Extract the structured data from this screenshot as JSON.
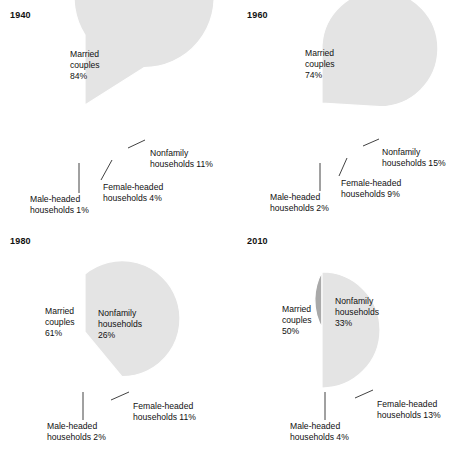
{
  "figure": {
    "background": "#ffffff",
    "colors": {
      "light": "#e4e4e4",
      "dark": "#a9a9a9",
      "separator": "#ffffff",
      "text": "#111111"
    }
  },
  "chart_data": [
    {
      "type": "pie",
      "title": "1940",
      "start_angle_deg": 90,
      "direction": "clockwise",
      "categories": [
        "Nonfamily households",
        "Female-headed households",
        "Male-headed households",
        "Married couples"
      ],
      "values": [
        11,
        4,
        1,
        84
      ],
      "slices": [
        {
          "name": "Nonfamily households",
          "value": 11,
          "value_label": "11%",
          "shade": "dark",
          "label_lines": [
            "Nonfamily",
            "households 11%"
          ],
          "label_mode": "callout",
          "label_x": 150,
          "label_y": 156,
          "lead": [
            128,
            148,
            145,
            140
          ]
        },
        {
          "name": "Female-headed households",
          "value": 4,
          "value_label": "4%",
          "shade": "dark",
          "label_lines": [
            "Female-headed",
            "households 4%"
          ],
          "label_mode": "callout",
          "label_x": 103,
          "label_y": 190,
          "lead": [
            101,
            180,
            112,
            160
          ]
        },
        {
          "name": "Male-headed households",
          "value": 1,
          "value_label": "1%",
          "shade": "light",
          "label_lines": [
            "Male-headed",
            "households 1%"
          ],
          "label_mode": "callout",
          "label_x": 30,
          "label_y": 202,
          "lead": [
            79,
            193,
            79,
            163
          ]
        },
        {
          "name": "Married couples",
          "value": 84,
          "value_label": "84%",
          "shade": "light",
          "label_lines": [
            "Married",
            "couples",
            "84%"
          ],
          "label_mode": "inside",
          "label_x": 70,
          "label_y": 57
        }
      ],
      "geometry": {
        "cx": 85,
        "cy": 105,
        "r": 70
      }
    },
    {
      "type": "pie",
      "title": "1960",
      "start_angle_deg": 90,
      "direction": "clockwise",
      "categories": [
        "Nonfamily households",
        "Female-headed households",
        "Male-headed households",
        "Married couples"
      ],
      "values": [
        15,
        9,
        2,
        74
      ],
      "slices": [
        {
          "name": "Nonfamily households",
          "value": 15,
          "value_label": "15%",
          "shade": "dark",
          "label_lines": [
            "Nonfamily",
            "households 15%"
          ],
          "label_mode": "callout",
          "label_x": 145,
          "label_y": 155,
          "lead": [
            126,
            146,
            142,
            139
          ]
        },
        {
          "name": "Female-headed households",
          "value": 9,
          "value_label": "9%",
          "shade": "dark",
          "label_lines": [
            "Female-headed",
            "households 9%"
          ],
          "label_mode": "callout",
          "label_x": 104,
          "label_y": 186,
          "lead": [
            102,
            176,
            110,
            158
          ]
        },
        {
          "name": "Male-headed households",
          "value": 2,
          "value_label": "2%",
          "shade": "light",
          "label_lines": [
            "Male-headed",
            "households 2%"
          ],
          "label_mode": "callout",
          "label_x": 33,
          "label_y": 200,
          "lead": [
            83,
            191,
            83,
            163
          ]
        },
        {
          "name": "Married couples",
          "value": 74,
          "value_label": "74%",
          "shade": "light",
          "label_lines": [
            "Married",
            "couples",
            "74%"
          ],
          "label_mode": "inside",
          "label_x": 68,
          "label_y": 56
        }
      ],
      "geometry": {
        "cx": 85,
        "cy": 103,
        "r": 58
      }
    },
    {
      "type": "pie",
      "title": "1980",
      "start_angle_deg": 90,
      "direction": "clockwise",
      "categories": [
        "Nonfamily households",
        "Female-headed households",
        "Male-headed households",
        "Married couples"
      ],
      "values": [
        26,
        11,
        2,
        61
      ],
      "slices": [
        {
          "name": "Nonfamily households",
          "value": 26,
          "value_label": "26%",
          "shade": "dark",
          "label_lines": [
            "Nonfamily",
            "households",
            "26%"
          ],
          "label_mode": "inside",
          "label_x": 98,
          "label_y": 90
        },
        {
          "name": "Female-headed households",
          "value": 11,
          "value_label": "11%",
          "shade": "dark",
          "label_lines": [
            "Female-headed",
            "households 11%"
          ],
          "label_mode": "callout",
          "label_x": 133,
          "label_y": 183,
          "lead": [
            111,
            174,
            129,
            166
          ]
        },
        {
          "name": "Male-headed households",
          "value": 2,
          "value_label": "2%",
          "shade": "light",
          "label_lines": [
            "Male-headed",
            "households 2%"
          ],
          "label_mode": "callout",
          "label_x": 47,
          "label_y": 203,
          "lead": [
            83,
            194,
            83,
            166
          ]
        },
        {
          "name": "Married couples",
          "value": 61,
          "value_label": "61%",
          "shade": "light",
          "label_lines": [
            "Married",
            "couples",
            "61%"
          ],
          "label_mode": "inside",
          "label_x": 45,
          "label_y": 88
        }
      ],
      "geometry": {
        "cx": 85,
        "cy": 106,
        "r": 58
      }
    },
    {
      "type": "pie",
      "title": "2010",
      "start_angle_deg": 90,
      "direction": "clockwise",
      "categories": [
        "Nonfamily households",
        "Female-headed households",
        "Male-headed households",
        "Married couples"
      ],
      "values": [
        33,
        13,
        4,
        50
      ],
      "slices": [
        {
          "name": "Nonfamily households",
          "value": 33,
          "value_label": "33%",
          "shade": "dark",
          "label_lines": [
            "Nonfamily",
            "households",
            "33%"
          ],
          "label_mode": "inside",
          "label_x": 98,
          "label_y": 78
        },
        {
          "name": "Female-headed households",
          "value": 13,
          "value_label": "13%",
          "shade": "dark",
          "label_lines": [
            "Female-headed",
            "households 13%"
          ],
          "label_mode": "callout",
          "label_x": 140,
          "label_y": 181,
          "lead": [
            118,
            172,
            136,
            164
          ]
        },
        {
          "name": "Male-headed households",
          "value": 4,
          "value_label": "4%",
          "shade": "light",
          "label_lines": [
            "Male-headed",
            "households 4%"
          ],
          "label_mode": "callout",
          "label_x": 53,
          "label_y": 203,
          "lead": [
            88,
            194,
            88,
            166
          ]
        },
        {
          "name": "Married couples",
          "value": 50,
          "value_label": "50%",
          "shade": "light",
          "label_lines": [
            "Married",
            "couples",
            "50%"
          ],
          "label_mode": "inside",
          "label_x": 45,
          "label_y": 86
        }
      ],
      "geometry": {
        "cx": 85,
        "cy": 104,
        "r": 58
      }
    }
  ]
}
